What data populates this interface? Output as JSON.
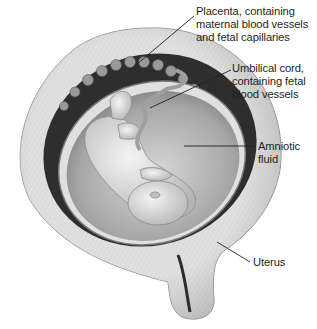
{
  "figure": {
    "labels": [
      {
        "id": "placenta",
        "text": "Placenta, containing\nmaternal blood vessels\nand fetal capillaries"
      },
      {
        "id": "umbilical_cord",
        "text": "Umbilical cord,\ncontaining fetal\nblood vessels"
      },
      {
        "id": "amniotic_fluid",
        "text": "Amniotic\nfluid"
      },
      {
        "id": "uterus",
        "text": "Uterus"
      }
    ]
  },
  "colors": {
    "text": "#231f20",
    "leader_line": "#231f20",
    "uterus_wall": "#c8c8c8",
    "placenta_dark": "#2a2a2a",
    "amniotic_sac": "#b0b0b0",
    "fetus": "#d9d9d9"
  }
}
